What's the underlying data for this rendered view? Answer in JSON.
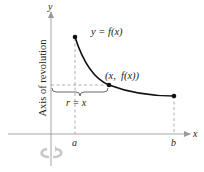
{
  "diagram": {
    "type": "solid-of-revolution-shell-method",
    "axes": {
      "x_label": "x",
      "y_label": "y",
      "color": "#9a9a9a"
    },
    "curve": {
      "label": "y = f(x)",
      "color": "#111111"
    },
    "point": {
      "label": "(x,  f(x))"
    },
    "ticks": {
      "a_label": "a",
      "b_label": "b"
    },
    "radius": {
      "label": "r = x"
    },
    "axis_of_revolution": {
      "label": "Axis of revolution"
    },
    "rotation_icon": {
      "name": "rotation-arrow",
      "color": "#c8c8c8"
    },
    "dashed_color": "#999999"
  }
}
